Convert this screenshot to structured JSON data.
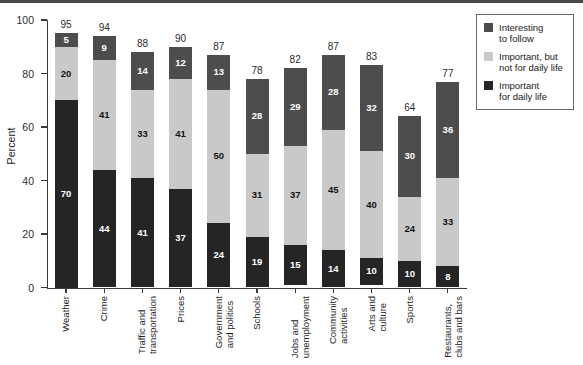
{
  "chart_data": {
    "type": "bar",
    "subtype": "stacked-vertical",
    "title": "",
    "xlabel": "",
    "ylabel": "Percent",
    "ylim": [
      0,
      100
    ],
    "yticks": [
      0,
      20,
      40,
      60,
      80,
      100
    ],
    "grid": false,
    "legend_position": "top-right",
    "categories": [
      "Weather",
      "Crime",
      "Traffic and\ntransportation",
      "Prices",
      "Government\nand politics",
      "Schools",
      "Jobs and\nunemployment",
      "Community\nactivities",
      "Arts and\nculture",
      "Sports",
      "Restaurants,\nclubs and bars"
    ],
    "series": [
      {
        "name": "Important\nfor daily life",
        "color": "#252525",
        "values": [
          70,
          44,
          41,
          37,
          24,
          19,
          15,
          14,
          10,
          10,
          8
        ]
      },
      {
        "name": "Important, but\nnot for daily life",
        "color": "#c9c9c9",
        "values": [
          20,
          41,
          33,
          41,
          50,
          31,
          37,
          45,
          40,
          24,
          33
        ]
      },
      {
        "name": "Interesting\nto follow",
        "color": "#4d4d4d",
        "values": [
          5,
          9,
          14,
          12,
          13,
          28,
          29,
          28,
          32,
          30,
          36
        ]
      }
    ],
    "totals": [
      95,
      94,
      88,
      90,
      87,
      78,
      82,
      87,
      83,
      64,
      77
    ]
  },
  "legend": {
    "items": [
      {
        "label": "Interesting\nto follow",
        "color": "#4d4d4d"
      },
      {
        "label": "Important, but\nnot for daily life",
        "color": "#c9c9c9"
      },
      {
        "label": "Important\nfor daily life",
        "color": "#252525"
      }
    ]
  },
  "axis": {
    "y_title": "Percent",
    "y_ticks": [
      "0",
      "20",
      "40",
      "60",
      "80",
      "100"
    ]
  }
}
